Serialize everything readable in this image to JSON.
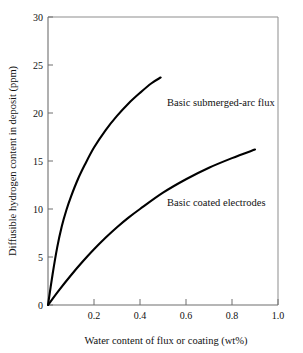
{
  "chart_data": {
    "type": "line",
    "title": "",
    "xlabel": "Water content of flux or coating (wt%)",
    "ylabel": "Diffusible hydrogen content in deposit (ppm)",
    "xlim": [
      0,
      1.0
    ],
    "ylim": [
      0,
      30
    ],
    "xticks": [
      "0.2",
      "0.4",
      "0.6",
      "0.8",
      "1.0"
    ],
    "xtick_values": [
      0.2,
      0.4,
      0.6,
      0.8,
      1.0
    ],
    "yticks": [
      "0",
      "5",
      "10",
      "15",
      "20",
      "25",
      "30"
    ],
    "ytick_values": [
      0,
      5,
      10,
      15,
      20,
      25,
      30
    ],
    "grid": false,
    "legend_position": "inline-annotations",
    "series": [
      {
        "name": "Basic submerged-arc flux",
        "annotation": "Basic submerged-arc flux",
        "color": "#000000",
        "x": [
          0.0,
          0.02,
          0.04,
          0.06,
          0.08,
          0.1,
          0.13,
          0.16,
          0.2,
          0.25,
          0.3,
          0.35,
          0.4,
          0.45,
          0.49
        ],
        "y": [
          0.0,
          3.2,
          6.0,
          8.2,
          9.9,
          11.3,
          13.1,
          14.6,
          16.4,
          18.2,
          19.7,
          21.0,
          22.1,
          23.1,
          23.7
        ]
      },
      {
        "name": "Basic coated electrodes",
        "annotation": "Basic coated electrodes",
        "color": "#000000",
        "x": [
          0.0,
          0.05,
          0.1,
          0.15,
          0.2,
          0.25,
          0.3,
          0.35,
          0.4,
          0.5,
          0.6,
          0.7,
          0.8,
          0.9
        ],
        "y": [
          0.0,
          1.6,
          3.1,
          4.5,
          5.8,
          7.0,
          8.1,
          9.1,
          10.0,
          11.7,
          13.1,
          14.3,
          15.3,
          16.2
        ]
      }
    ]
  },
  "labels": {
    "y_axis_title": "Diffusible hydrogen content in deposit (ppm)",
    "x_axis_title": "Water content of flux or coating (wt%)",
    "curve_upper": "Basic submerged-arc flux",
    "curve_lower": "Basic coated electrodes",
    "y0": "0",
    "y5": "5",
    "y10": "10",
    "y15": "15",
    "y20": "20",
    "y25": "25",
    "y30": "30",
    "x02": "0.2",
    "x04": "0.4",
    "x06": "0.6",
    "x08": "0.8",
    "x10": "1.0"
  },
  "colors": {
    "background": "#ffffff",
    "curve": "#000000",
    "frame": "#8d8d8d",
    "text": "#111111"
  }
}
